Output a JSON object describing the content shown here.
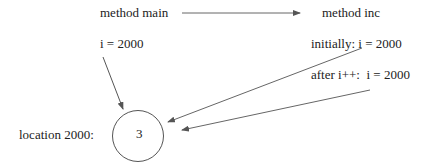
{
  "diagram": {
    "title_left": "method main",
    "title_right": "method inc",
    "main_var": "i = 2000",
    "inc_initial": "initially: i = 2000",
    "inc_after": "after i++:  i = 2000",
    "location_label": "location 2000:",
    "cell_value": "3",
    "colors": {
      "line": "#555555",
      "text": "#222222",
      "background": "#ffffff"
    }
  }
}
